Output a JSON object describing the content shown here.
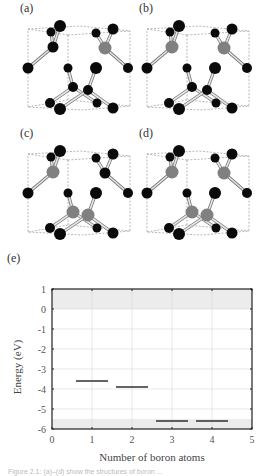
{
  "figure": {
    "panels": [
      {
        "label": "(a)",
        "boron_sites": [
          "upper-right"
        ],
        "boron_count": 1
      },
      {
        "label": "(b)",
        "boron_sites": [
          "upper-left",
          "upper-right"
        ],
        "boron_count": 2
      },
      {
        "label": "(c)",
        "boron_sites": [
          "upper-left",
          "lower-left",
          "lower-right"
        ],
        "boron_count": 3
      },
      {
        "label": "(d)",
        "boron_sites": [
          "upper-left",
          "upper-right",
          "lower-left",
          "lower-right"
        ],
        "boron_count": 4
      }
    ],
    "chart_label": "(e)",
    "caption": "Figure 2.1: (a)–(d) show the structures of boron ..."
  },
  "colors": {
    "carbon_atom": "#0a0a0a",
    "boron_atom": "#808080",
    "bond": "#bdbdbd",
    "cell_edge": "#9a9a9a",
    "band_shade": "#ececec",
    "level_line": "#222222",
    "axis": "#222222",
    "grid": "#d8d8d8"
  },
  "chart_data": {
    "type": "line",
    "title": "",
    "xlabel": "Number of boron atoms",
    "ylabel": "Energy (eV)",
    "xlim": [
      0,
      5
    ],
    "ylim": [
      -6,
      1
    ],
    "xticks": [
      "0",
      "1",
      "2",
      "3",
      "4",
      "5"
    ],
    "yticks": [
      "1",
      "0",
      "-1",
      "-2",
      "-3",
      "-4",
      "-5",
      "-6"
    ],
    "grid": true,
    "shaded_bands": [
      {
        "name": "conduction band",
        "y_from": 0,
        "y_to": 1
      },
      {
        "name": "valence band",
        "y_from": -6,
        "y_to": -5.5
      }
    ],
    "series": [
      {
        "name": "defect level",
        "segments": [
          {
            "x_center": 1,
            "x_from": 0.6,
            "x_to": 1.4,
            "y": -3.6
          },
          {
            "x_center": 2,
            "x_from": 1.6,
            "x_to": 2.4,
            "y": -3.9
          },
          {
            "x_center": 3,
            "x_from": 2.6,
            "x_to": 3.4,
            "y": -5.6
          },
          {
            "x_center": 4,
            "x_from": 3.6,
            "x_to": 4.4,
            "y": -5.6
          }
        ]
      }
    ]
  }
}
